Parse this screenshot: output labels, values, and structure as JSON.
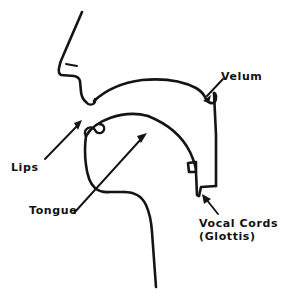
{
  "figure": {
    "kind": "hand-drawn-line-diagram",
    "background_color": "#ffffff",
    "ink_color": "#141414",
    "width": 283,
    "height": 297
  },
  "labels": {
    "velum": "Velum",
    "lips": "Lips",
    "tongue": "Tongue",
    "vocal_cords_line1": "Vocal Cords",
    "vocal_cords_line2": "(Glottis)"
  },
  "caption": {
    "text": "",
    "visible": false
  },
  "annotations": [
    {
      "name": "velum-pointer",
      "label": "Velum",
      "arrow_from": [
        223,
        79
      ],
      "arrow_to": [
        204,
        99
      ],
      "direction": "down-left"
    },
    {
      "name": "lips-pointer",
      "label": "Lips",
      "arrow_from": [
        45,
        159
      ],
      "arrow_to": [
        81,
        122
      ],
      "direction": "up-right"
    },
    {
      "name": "tongue-pointer",
      "label": "Tongue",
      "arrow_from": [
        74,
        213
      ],
      "arrow_to": [
        146,
        134
      ],
      "direction": "up-right"
    },
    {
      "name": "vocal-cords-pointer",
      "label": "Vocal Cords (Glottis)",
      "arrow_from": [
        218,
        214
      ],
      "arrow_to": [
        203,
        196
      ],
      "direction": "up-left"
    }
  ],
  "anatomy_parts": [
    "nose-and-face-profile",
    "nostril-mark",
    "upper-lip-and-mouth-opening",
    "hard-palate-arch",
    "velum-soft-palate-hook",
    "pharyngeal-back-wall",
    "pharyngeal-front-wall",
    "glottis-notch",
    "tongue-body",
    "jaw-and-neck-contour"
  ]
}
